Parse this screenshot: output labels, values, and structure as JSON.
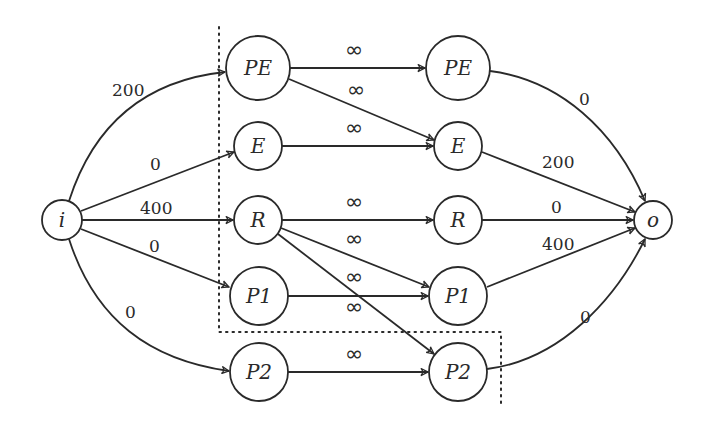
{
  "diagram": {
    "title": "",
    "colors": {
      "stroke": "#2a2a2a",
      "background": "#ffffff"
    },
    "nodes": [
      {
        "id": "i",
        "label": "i",
        "x": 62,
        "y": 220,
        "r": 20
      },
      {
        "id": "o",
        "label": "o",
        "x": 653,
        "y": 220,
        "r": 19
      },
      {
        "id": "PE_l",
        "label": "PE",
        "x": 258,
        "y": 68,
        "r": 32
      },
      {
        "id": "E_l",
        "label": "E",
        "x": 258,
        "y": 146,
        "r": 24
      },
      {
        "id": "R_l",
        "label": "R",
        "x": 258,
        "y": 220,
        "r": 24
      },
      {
        "id": "P1_l",
        "label": "P1",
        "x": 259,
        "y": 296,
        "r": 29
      },
      {
        "id": "P2_l",
        "label": "P2",
        "x": 259,
        "y": 372,
        "r": 29
      },
      {
        "id": "PE_r",
        "label": "PE",
        "x": 458,
        "y": 68,
        "r": 32
      },
      {
        "id": "E_r",
        "label": "E",
        "x": 458,
        "y": 146,
        "r": 24
      },
      {
        "id": "R_r",
        "label": "R",
        "x": 458,
        "y": 220,
        "r": 24
      },
      {
        "id": "P1_r",
        "label": "P1",
        "x": 458,
        "y": 296,
        "r": 29
      },
      {
        "id": "P2_r",
        "label": "P2",
        "x": 458,
        "y": 372,
        "r": 29
      }
    ],
    "edges": [
      {
        "from": "i",
        "to": "PE_l",
        "label": "200",
        "curve": "up"
      },
      {
        "from": "i",
        "to": "E_l",
        "label": "0"
      },
      {
        "from": "i",
        "to": "R_l",
        "label": "400"
      },
      {
        "from": "i",
        "to": "P1_l",
        "label": "0"
      },
      {
        "from": "i",
        "to": "P2_l",
        "label": "0",
        "curve": "down"
      },
      {
        "from": "PE_l",
        "to": "PE_r",
        "label": "∞"
      },
      {
        "from": "PE_l",
        "to": "E_r",
        "label": "∞"
      },
      {
        "from": "E_l",
        "to": "E_r",
        "label": "∞"
      },
      {
        "from": "R_l",
        "to": "R_r",
        "label": "∞"
      },
      {
        "from": "R_l",
        "to": "P1_r",
        "label": "∞"
      },
      {
        "from": "R_l",
        "to": "P2_r",
        "label": "∞"
      },
      {
        "from": "P1_l",
        "to": "P1_r",
        "label": "∞"
      },
      {
        "from": "P2_l",
        "to": "P2_r",
        "label": "∞"
      },
      {
        "from": "PE_r",
        "to": "o",
        "label": "0",
        "curve": "up"
      },
      {
        "from": "E_r",
        "to": "o",
        "label": "200"
      },
      {
        "from": "R_r",
        "to": "o",
        "label": "0"
      },
      {
        "from": "P1_r",
        "to": "o",
        "label": "400"
      },
      {
        "from": "P2_r",
        "to": "o",
        "label": "0",
        "curve": "down"
      }
    ],
    "cut": {
      "style": "dotted",
      "description": "cut boundary separating source side"
    }
  }
}
